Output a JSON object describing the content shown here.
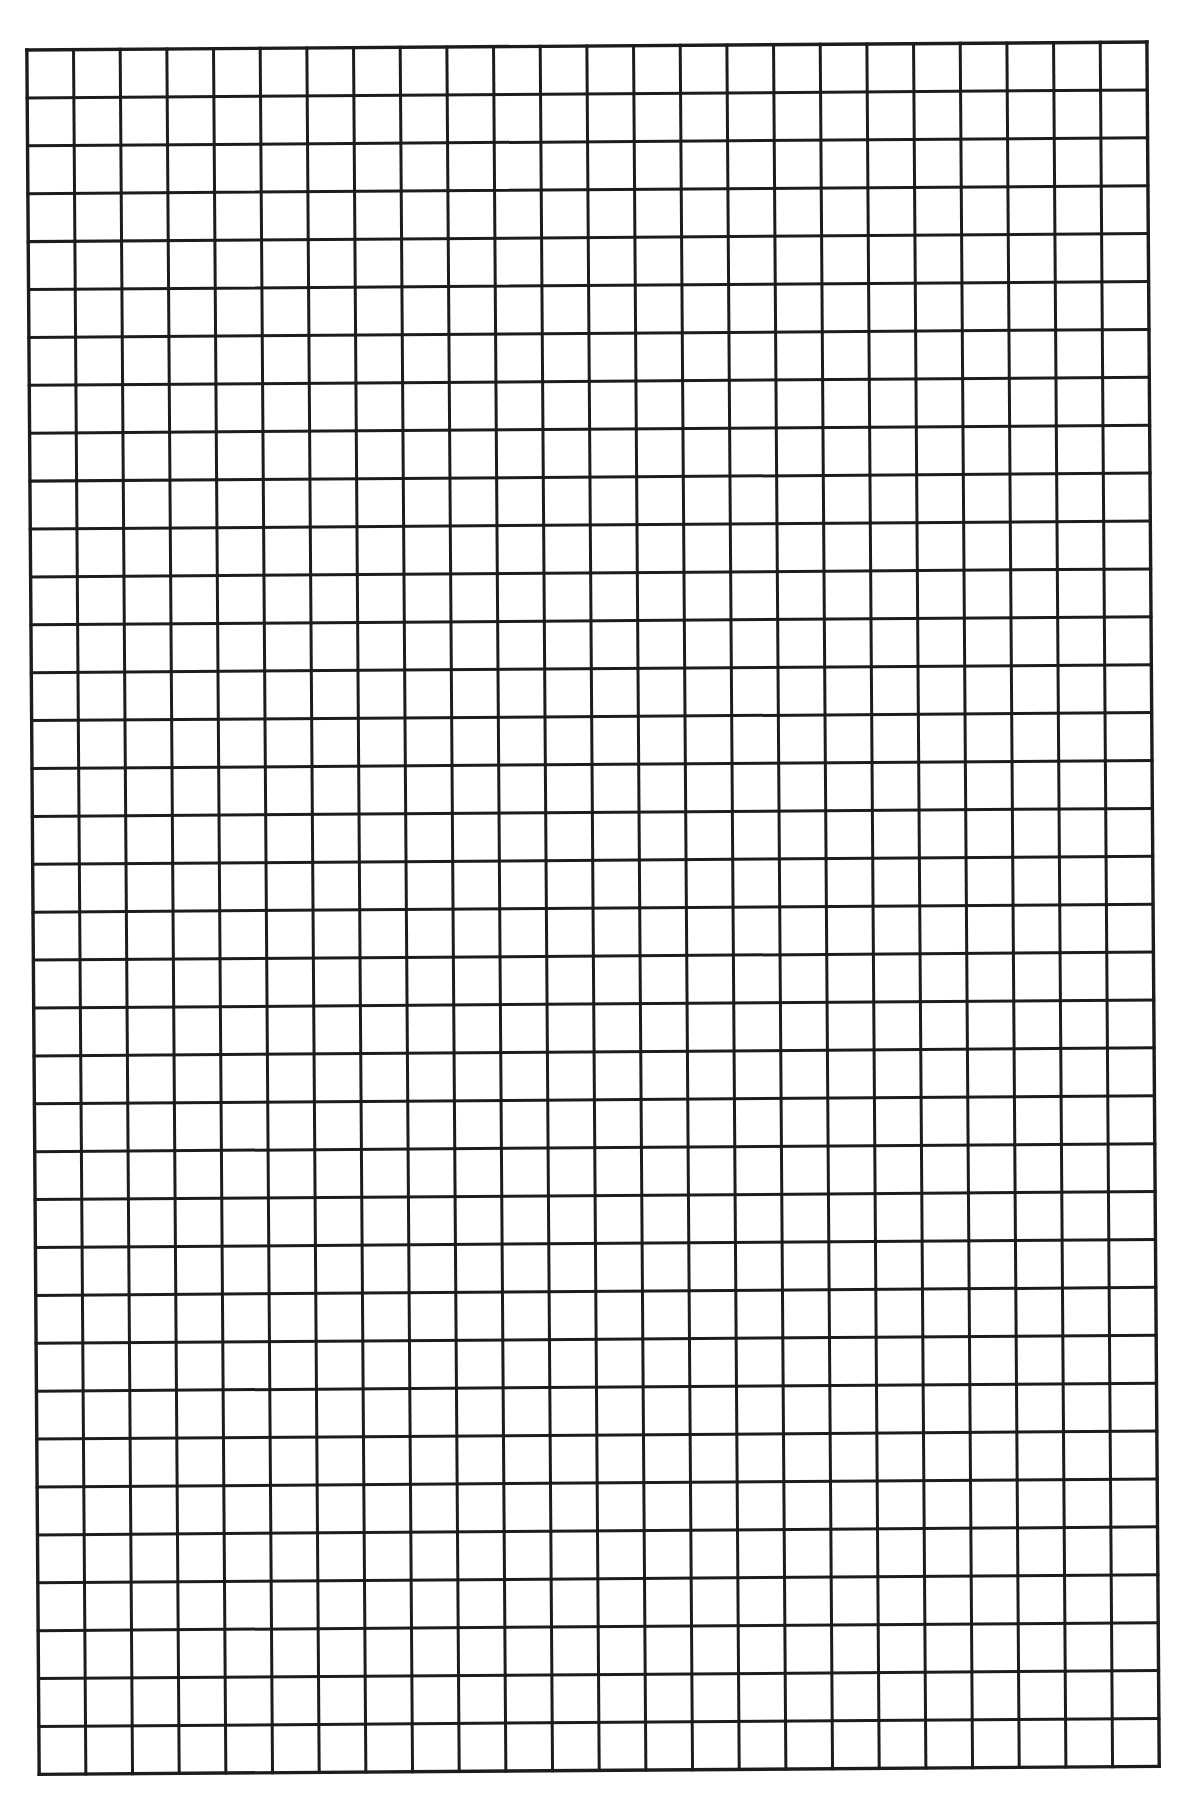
{
  "page": {
    "type": "graph-paper",
    "background": "#ffffff"
  },
  "grid": {
    "columns": 24,
    "rows": 36,
    "cell_width_px": 46.67,
    "cell_height_px": 47.9,
    "line_color": "#1c1c1c",
    "line_width_px": 3,
    "border_width_px": 3.4,
    "rotation_deg": -0.41,
    "corners_px": {
      "top_left": [
        28,
        50
      ],
      "top_right": [
        1148,
        42
      ],
      "bottom_left": [
        40,
        1774
      ],
      "bottom_right": [
        1157,
        1766
      ]
    }
  }
}
